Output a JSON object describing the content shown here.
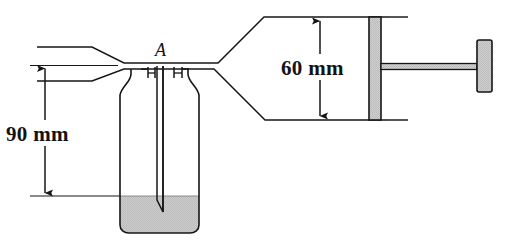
{
  "figure": {
    "background_color": "#ffffff",
    "line_color": "#161616",
    "fill_gray": "#c9c9c9",
    "liquid_gray": "#c6c6c6"
  },
  "labels": {
    "point_a": "A",
    "height_90": "90 mm",
    "height_60": "60 mm"
  },
  "dimensions": [
    {
      "name": "height-90",
      "text": "90 mm",
      "value": 90,
      "unit": "mm",
      "orientation": "vertical",
      "measures": "throat centerline to liquid free surface"
    },
    {
      "name": "height-60",
      "text": "60 mm",
      "value": 60,
      "unit": "mm",
      "orientation": "vertical",
      "measures": "cylinder bore diameter"
    }
  ],
  "components": [
    {
      "name": "inlet-duct",
      "description": "converging inlet duct at left"
    },
    {
      "name": "throat",
      "description": "narrow throat section labeled A"
    },
    {
      "name": "diffuser",
      "description": "diverging duct expanding to cylinder"
    },
    {
      "name": "cylinder",
      "description": "horizontal cylinder bore 60 mm"
    },
    {
      "name": "piston",
      "description": "gray piston inside cylinder"
    },
    {
      "name": "piston-rod",
      "description": "thin rod connecting piston to handle"
    },
    {
      "name": "piston-handle",
      "description": "vertical gray handle at right end of rod"
    },
    {
      "name": "bottle",
      "description": "reservoir bottle hanging below throat"
    },
    {
      "name": "dip-tube",
      "description": "slender tube from throat into liquid"
    },
    {
      "name": "liquid",
      "description": "shaded liquid in bottom of bottle"
    }
  ]
}
